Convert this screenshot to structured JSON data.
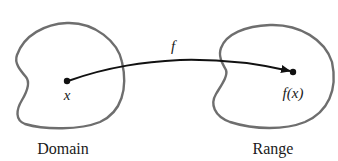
{
  "diagram": {
    "type": "function-mapping",
    "domain": {
      "label": "Domain",
      "point_label": "x"
    },
    "range": {
      "label": "Range",
      "point_label": "f(x)"
    },
    "arrow": {
      "label": "f"
    },
    "colors": {
      "blob_outline": "#6e6e6e",
      "arrow": "#111111",
      "point": "#111111"
    }
  }
}
